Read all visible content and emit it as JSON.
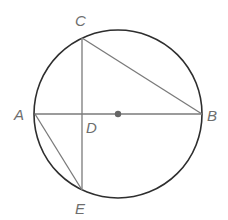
{
  "diagram": {
    "type": "circle-geometry",
    "circle": {
      "cx": 118,
      "cy": 114,
      "r": 84,
      "stroke": "#2e2e2e"
    },
    "center_dot": {
      "x": 118,
      "y": 114,
      "color": "#666666"
    },
    "points": {
      "A": {
        "x": 35,
        "y": 114
      },
      "B": {
        "x": 202,
        "y": 114
      },
      "C": {
        "x": 82,
        "y": 38
      },
      "D": {
        "x": 82,
        "y": 114
      },
      "E": {
        "x": 82,
        "y": 190
      }
    },
    "segments": [
      [
        "A",
        "B"
      ],
      [
        "C",
        "E"
      ],
      [
        "C",
        "B"
      ],
      [
        "A",
        "E"
      ]
    ],
    "line_color": "#7a7a7a",
    "labels": [
      {
        "text": "A",
        "x": 14,
        "y": 120
      },
      {
        "text": "B",
        "x": 207,
        "y": 121
      },
      {
        "text": "C",
        "x": 75,
        "y": 26
      },
      {
        "text": "D",
        "x": 86,
        "y": 133
      },
      {
        "text": "E",
        "x": 75,
        "y": 214
      }
    ]
  }
}
